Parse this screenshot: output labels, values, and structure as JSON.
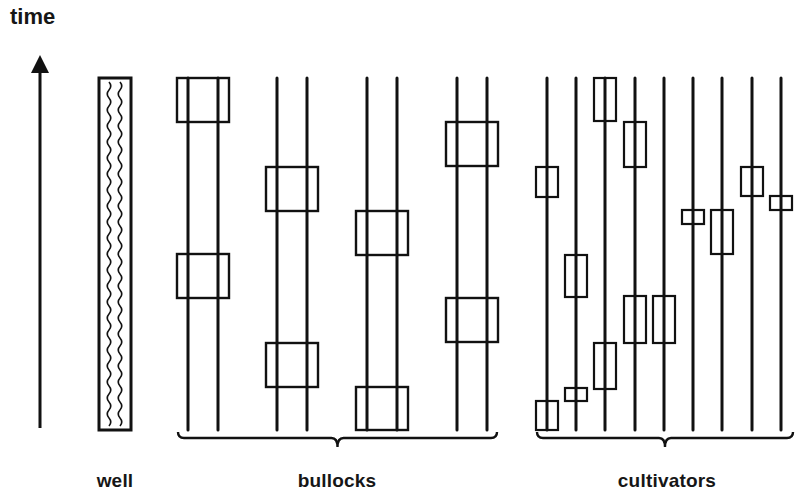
{
  "diagram": {
    "axis_label": "time",
    "colors": {
      "ink": "#111111",
      "background": "#ffffff"
    },
    "time_arrow": {
      "x": 40,
      "y_top": 55,
      "y_bottom": 428
    },
    "well": {
      "label": "well",
      "x": 99,
      "width": 32,
      "y_top": 78,
      "y_bottom": 430,
      "label_x": 115
    },
    "bullocks": {
      "label": "bullocks",
      "label_x": 337,
      "brace": {
        "x1": 178,
        "x2": 497,
        "y": 438
      },
      "pairs": [
        {
          "lines": [
            188,
            218
          ],
          "work_periods": [
            [
              78,
              122
            ],
            [
              254,
              298
            ]
          ]
        },
        {
          "lines": [
            277,
            307
          ],
          "work_periods": [
            [
              167,
              211
            ],
            [
              343,
              387
            ]
          ]
        },
        {
          "lines": [
            367,
            397
          ],
          "work_periods": [
            [
              211,
              255
            ],
            [
              387,
              430
            ]
          ]
        },
        {
          "lines": [
            457,
            487
          ],
          "work_periods": [
            [
              122,
              166
            ],
            [
              298,
              342
            ]
          ]
        }
      ]
    },
    "cultivators": {
      "label": "cultivators",
      "label_x": 667,
      "brace": {
        "x1": 537,
        "x2": 793,
        "y": 438
      },
      "lines": [
        {
          "x": 547,
          "work_periods": [
            [
              167,
              197
            ],
            [
              401,
              430
            ]
          ]
        },
        {
          "x": 576,
          "work_periods": [
            [
              255,
              297
            ],
            [
              388,
              401
            ]
          ]
        },
        {
          "x": 605,
          "work_periods": [
            [
              78,
              121
            ],
            [
              343,
              389
            ]
          ]
        },
        {
          "x": 635,
          "work_periods": [
            [
              122,
              167
            ],
            [
              296,
              343
            ]
          ]
        },
        {
          "x": 664,
          "work_periods": [
            [
              296,
              343
            ]
          ]
        },
        {
          "x": 693,
          "work_periods": [
            [
              210,
              224
            ]
          ]
        },
        {
          "x": 722,
          "work_periods": [
            [
              210,
              254
            ]
          ]
        },
        {
          "x": 752,
          "work_periods": [
            [
              167,
              196
            ]
          ]
        },
        {
          "x": 781,
          "work_periods": [
            [
              196,
              210
            ]
          ]
        }
      ]
    },
    "line_y_top": 78,
    "line_y_bottom": 430
  }
}
